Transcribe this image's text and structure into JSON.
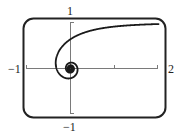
{
  "chart_data": {
    "type": "line",
    "title": "",
    "xlabel": "",
    "ylabel": "",
    "equation": "r = 1/theta (hyperbolic spiral)",
    "xlim": [
      -1,
      2
    ],
    "ylim": [
      -1,
      1
    ],
    "grid": false,
    "legend": null,
    "tick_labels": {
      "x_min": "−1",
      "x_max": "2",
      "y_max": "1",
      "y_min": "−1"
    },
    "x_ticks": [
      -1,
      1,
      2
    ],
    "y_ticks": [
      -1,
      1
    ],
    "theta_range": [
      0.45,
      40
    ],
    "series": [
      {
        "name": "spiral",
        "points": [
          [
            2.001,
            0.967
          ],
          [
            1.755,
            0.959
          ],
          [
            1.376,
            0.941
          ],
          [
            1.093,
            0.92
          ],
          [
            0.871,
            0.897
          ],
          [
            0.54,
            0.841
          ],
          [
            0.302,
            0.777
          ],
          [
            0.121,
            0.704
          ],
          [
            0.0,
            0.637
          ],
          [
            -0.126,
            0.541
          ],
          [
            -0.24,
            0.411
          ],
          [
            -0.32,
            0.239
          ],
          [
            -0.318,
            0.0
          ],
          [
            -0.208,
            -0.161
          ],
          [
            0.0,
            -0.212
          ],
          [
            0.159,
            0.0
          ],
          [
            0.0,
            0.127
          ],
          [
            -0.106,
            0.0
          ],
          [
            0.0,
            -0.091
          ]
        ]
      }
    ],
    "frame": {
      "style": "rounded-rectangle",
      "stroke": "#222222"
    },
    "colors": {
      "curve": "#1a1a1a",
      "axes": "#777777",
      "frame": "#222222",
      "text": "#222222"
    }
  }
}
